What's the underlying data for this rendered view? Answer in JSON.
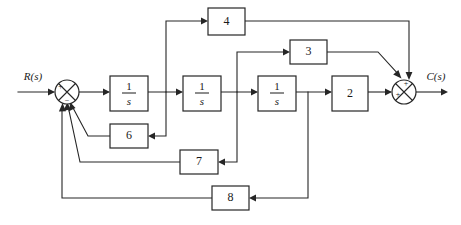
{
  "diagram": {
    "type": "signal-flow-block-diagram",
    "input_label": "R(s)",
    "output_label": "C(s)",
    "stroke_color": "#262626",
    "background_color": "#ffffff",
    "blocks": [
      {
        "id": "integrator-1",
        "label_numerator": "1",
        "label_denominator": "s",
        "display": "1/s",
        "x": 110,
        "y": 76,
        "w": 38,
        "h": 35
      },
      {
        "id": "integrator-2",
        "label_numerator": "1",
        "label_denominator": "s",
        "display": "1/s",
        "x": 183,
        "y": 76,
        "w": 38,
        "h": 35
      },
      {
        "id": "integrator-3",
        "label_numerator": "1",
        "label_denominator": "s",
        "display": "1/s",
        "x": 258,
        "y": 76,
        "w": 38,
        "h": 35
      },
      {
        "id": "gain-2",
        "label": "2",
        "x": 332,
        "y": 76,
        "w": 36,
        "h": 35
      },
      {
        "id": "gain-4",
        "label": "4",
        "x": 208,
        "y": 8,
        "w": 37,
        "h": 27
      },
      {
        "id": "gain-3",
        "label": "3",
        "x": 290,
        "y": 40,
        "w": 37,
        "h": 24
      },
      {
        "id": "gain-6",
        "label": "6",
        "x": 110,
        "y": 124,
        "w": 38,
        "h": 24
      },
      {
        "id": "gain-7",
        "label": "7",
        "x": 180,
        "y": 150,
        "w": 38,
        "h": 24
      },
      {
        "id": "gain-8",
        "label": "8",
        "x": 212,
        "y": 186,
        "w": 37,
        "h": 24
      }
    ],
    "summing_junctions": [
      {
        "id": "input-summer",
        "cx": 67,
        "cy": 92,
        "r": 12,
        "signs": [
          {
            "symbol": "+",
            "position": "left"
          },
          {
            "symbol": "−",
            "position": "bottom"
          }
        ]
      },
      {
        "id": "output-summer",
        "cx": 404,
        "cy": 92,
        "r": 12,
        "signs": [
          {
            "symbol": "+",
            "position": "left"
          },
          {
            "symbol": "+",
            "position": "top"
          }
        ]
      }
    ],
    "forward_path": [
      "R(s)",
      "input-summer",
      "integrator-1",
      "integrator-2",
      "integrator-3",
      "gain-2",
      "output-summer",
      "C(s)"
    ],
    "feedforward_paths": [
      {
        "id": "path-4",
        "from": "after-integrator-1",
        "through": "gain-4",
        "to": "output-summer",
        "sign": "+"
      },
      {
        "id": "path-3",
        "from": "after-integrator-2",
        "through": "gain-3",
        "to": "output-summer",
        "sign": "+"
      }
    ],
    "feedback_paths": [
      {
        "id": "path-6",
        "from": "after-integrator-2",
        "through": "gain-6",
        "to": "input-summer",
        "sign": "−"
      },
      {
        "id": "path-7",
        "from": "after-integrator-3-tap",
        "through": "gain-7",
        "to": "input-summer",
        "sign": "−"
      },
      {
        "id": "path-8",
        "from": "after-integrator-3-output",
        "through": "gain-8",
        "to": "input-summer",
        "sign": "−"
      }
    ]
  }
}
